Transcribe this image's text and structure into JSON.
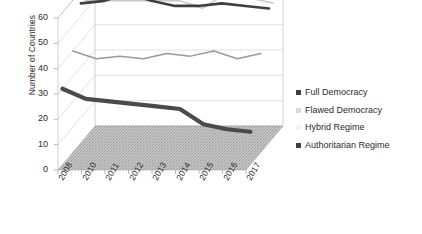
{
  "chart_data": {
    "type": "line",
    "title": "",
    "xlabel": "",
    "ylabel": "Number of Countries",
    "ylim": [
      0,
      60
    ],
    "ytick_step": 10,
    "yticks": [
      "0",
      "10",
      "20",
      "30",
      "40",
      "50",
      "60"
    ],
    "categories": [
      "2008",
      "2010",
      "2011",
      "2012",
      "2013",
      "2014",
      "2015",
      "2016",
      "2017"
    ],
    "grid": true,
    "three_d": true,
    "legend_position": "right",
    "series": [
      {
        "name": "Full Democracy",
        "color": "#3f3f3f",
        "values": [
          55,
          56,
          59,
          56,
          54,
          54,
          55,
          54,
          53
        ]
      },
      {
        "name": "Flawed Democracy",
        "color": "#c9c9c9",
        "values": [
          54,
          54,
          54,
          54,
          54,
          51,
          57,
          55,
          53
        ]
      },
      {
        "name": "Hybrid Regime",
        "color": "#9a9a9a",
        "values": [
          40,
          37,
          38,
          37,
          39,
          38,
          40,
          37,
          39
        ]
      },
      {
        "name": "Authoritarian Regime",
        "color": "#4a4a4a",
        "values": [
          30,
          26,
          25,
          24,
          23,
          22,
          16,
          14,
          13
        ]
      }
    ]
  },
  "legend": {
    "items": [
      {
        "label": "Full Democracy",
        "swatch": "#3f3f3f"
      },
      {
        "label": "Flawed Democracy",
        "swatch": "#d8d8d8"
      },
      {
        "label": "Hybrid Regime",
        "swatch": "#f2f2f2"
      },
      {
        "label": "Authoritarian Regime",
        "swatch": "#3f3f3f"
      }
    ]
  },
  "colors": {
    "axis": "#b4b4b4",
    "grid": "#cccccc",
    "floor": "#b8b8b8",
    "text": "#2b2b2b"
  }
}
